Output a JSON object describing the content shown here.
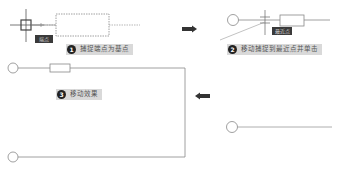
{
  "steps": [
    {
      "number": "1",
      "label": "捕捉端点为基点",
      "tag": "端点"
    },
    {
      "number": "2",
      "label": "移动捕捉到最近点并单击",
      "tag": "最近点"
    },
    {
      "number": "3",
      "label": "移动效果"
    }
  ],
  "colors": {
    "line": "#8c8c8c",
    "label_bg": "#d9d9d9",
    "badge": "#222222",
    "arrow": "#333333",
    "tag_bg": "#3a3a3a"
  }
}
